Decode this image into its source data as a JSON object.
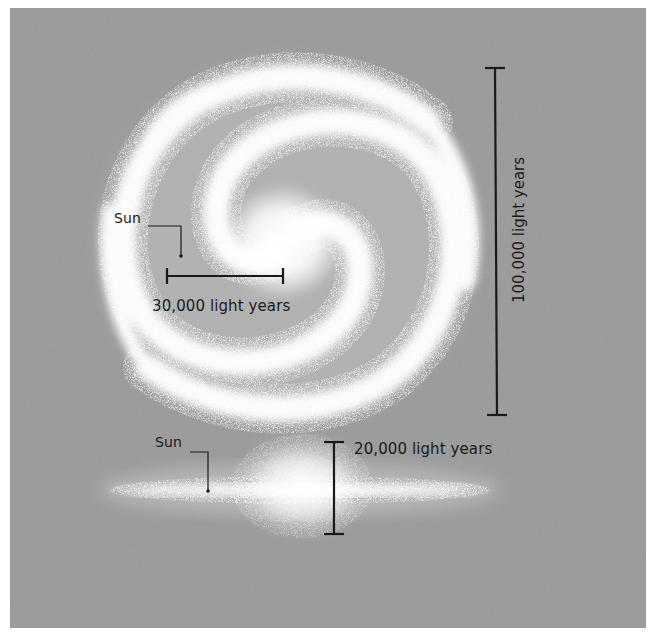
{
  "diagram": {
    "background_color": "#9a9a9a",
    "border_color": "#ffffff",
    "galaxy_color": "#ffffff",
    "ink_color": "#1a1a1a",
    "face_on_view": {
      "sun_label": "Sun",
      "scale_bar_horizontal": {
        "label": "30,000 light years",
        "value": 30000,
        "unit": "light years"
      },
      "scale_bar_vertical": {
        "label": "100,000 light years",
        "value": 100000,
        "unit": "light years"
      }
    },
    "edge_on_view": {
      "sun_label": "Sun",
      "scale_bar_vertical": {
        "label": "20,000 light years",
        "value": 20000,
        "unit": "light years"
      }
    }
  }
}
